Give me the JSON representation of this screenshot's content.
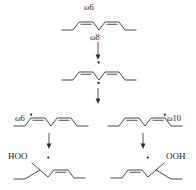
{
  "diagram": {
    "background_color": "#ffffff",
    "line_color": "#2b2b2b",
    "text_color": "#1a1a1a"
  },
  "labels": {
    "top_omega6": "ω6",
    "top_omega8": "ω8",
    "left_omega6": "ω6",
    "right_omega10": "ω10",
    "left_product_group": "HOO",
    "right_product_group": "OOH"
  },
  "structures": [
    {
      "id": "parent-diene",
      "name": "parent-1-4-diene",
      "row": 1,
      "radical_dots": 0,
      "double_bonds": 2,
      "annotations": [
        "ω6",
        "ω8"
      ]
    },
    {
      "id": "pentadienyl-radical",
      "name": "pentadienyl-radical",
      "row": 2,
      "radical_dots": 2,
      "double_bonds": 2,
      "annotations": []
    },
    {
      "id": "omega6-radical",
      "name": "omega6-allylic-radical",
      "row": 3,
      "side": "left",
      "radical_dots": 1,
      "double_bonds": 2,
      "annotations": [
        "ω6"
      ]
    },
    {
      "id": "omega10-radical",
      "name": "omega10-allylic-radical",
      "row": 3,
      "side": "right",
      "radical_dots": 1,
      "double_bonds": 2,
      "annotations": [
        "ω10"
      ]
    },
    {
      "id": "omega6-hydroperoxide",
      "name": "omega6-hydroperoxide-product",
      "row": 4,
      "side": "left",
      "radical_dots": 1,
      "double_bonds": 2,
      "annotations": [
        "HOO"
      ]
    },
    {
      "id": "omega10-hydroperoxide",
      "name": "omega10-hydroperoxide-product",
      "row": 4,
      "side": "right",
      "radical_dots": 1,
      "double_bonds": 2,
      "annotations": [
        "OOH"
      ]
    }
  ],
  "arrows": [
    {
      "id": "arrow-parent-to-radical",
      "name": "reaction-arrow-down-1",
      "direction": "down"
    },
    {
      "id": "arrow-radical-branch",
      "name": "reaction-arrow-down-2",
      "direction": "down"
    },
    {
      "id": "arrow-left-to-product",
      "name": "reaction-arrow-down-left",
      "direction": "down"
    },
    {
      "id": "arrow-right-to-product",
      "name": "reaction-arrow-down-right",
      "direction": "down"
    }
  ]
}
